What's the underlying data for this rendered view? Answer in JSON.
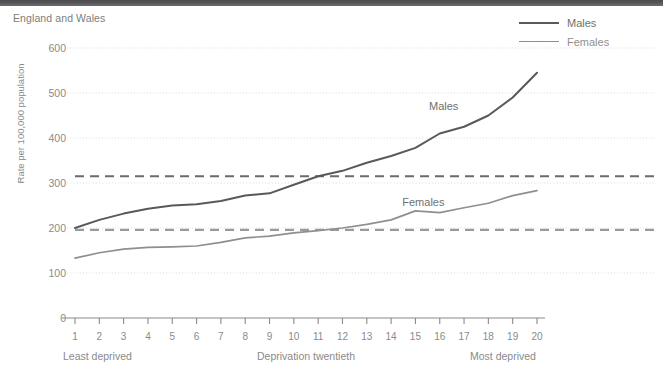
{
  "header": {
    "bar_color": "#56565a"
  },
  "chart_data": {
    "type": "line",
    "title": "",
    "subtitle": "England and Wales",
    "xlabel": "Deprivation twentieth",
    "ylabel": "Rate per 100,000 population",
    "x_axis_left_note": "Least deprived",
    "x_axis_right_note": "Most deprived",
    "categories": [
      "1",
      "2",
      "3",
      "4",
      "5",
      "6",
      "7",
      "8",
      "9",
      "10",
      "11",
      "12",
      "13",
      "14",
      "15",
      "16",
      "17",
      "18",
      "19",
      "20"
    ],
    "ylim": [
      0,
      600
    ],
    "yticks": [
      0,
      100,
      200,
      300,
      400,
      500,
      600
    ],
    "ytick_labels": [
      "0",
      "100",
      "200",
      "300",
      "400",
      "500",
      "600"
    ],
    "grid": true,
    "legend_position": "top-right",
    "series": [
      {
        "name": "Males",
        "color": "#595959",
        "inline_label": "Males",
        "values": [
          200,
          218,
          232,
          243,
          250,
          253,
          260,
          272,
          277,
          296,
          315,
          327,
          345,
          360,
          378,
          410,
          425,
          450,
          490,
          545
        ]
      },
      {
        "name": "Females",
        "color": "#8f8f8f",
        "inline_label": "Females",
        "values": [
          133,
          145,
          153,
          157,
          158,
          160,
          168,
          178,
          182,
          189,
          194,
          200,
          208,
          218,
          238,
          234,
          245,
          255,
          272,
          283
        ]
      }
    ],
    "reference_lines": [
      {
        "name": "Males average",
        "value": 315,
        "color": "#6b6b6b",
        "style": "dashed"
      },
      {
        "name": "Females average",
        "value": 196,
        "color": "#9a9a9a",
        "style": "dashed"
      }
    ],
    "annotations": [
      {
        "text": "Males",
        "x": 16.3,
        "y": 468
      },
      {
        "text": "Females",
        "x": 15.2,
        "y": 255
      }
    ]
  }
}
